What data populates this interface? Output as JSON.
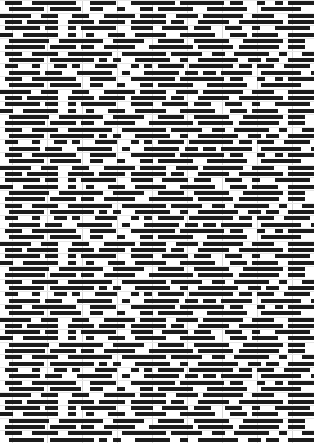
{
  "pattern": {
    "kind": "weave-drawdown",
    "width": 314,
    "height": 443,
    "row_height": 6.33,
    "cell_width": 4.5,
    "dash_thickness": 4,
    "major_grid_spacing": 35,
    "colors": {
      "background": "#ffffff",
      "dash": "#1c1c1c",
      "grid_major": "#d6d6d6",
      "grid_minor": "#e6e6e6"
    },
    "repeat_rows": 12,
    "repeat_cols": 70,
    "seed": 7
  }
}
